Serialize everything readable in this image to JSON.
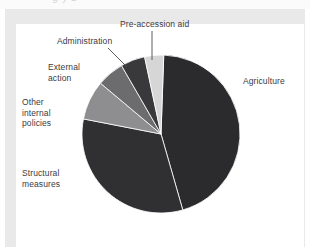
{
  "page": {
    "title_partial": "g      y      z",
    "background": "#ffffff",
    "frame_color": "#e9e9e9"
  },
  "chart_data": {
    "type": "pie",
    "title": "",
    "xlabel": "",
    "ylabel": "",
    "legend_position": "none",
    "labels_placement": "outside-with-leader-lines",
    "grid": false,
    "start_angle_deg": -90,
    "direction": "clockwise",
    "categories": [
      "Agriculture",
      "Structural measures",
      "Other internal policies",
      "External action",
      "Administration",
      "Pre-accession aid"
    ],
    "values": [
      45.0,
      32.5,
      8.0,
      5.5,
      5.0,
      4.0
    ],
    "slices": [
      {
        "label": "Agriculture",
        "value": 45.0,
        "color": "#2b2b2d",
        "start_deg": 2,
        "end_deg": 164
      },
      {
        "label": "Structural measures",
        "value": 32.5,
        "color": "#303032",
        "start_deg": 164,
        "end_deg": 281
      },
      {
        "label": "Other internal policies",
        "value": 8.0,
        "color": "#8e8e90",
        "start_deg": 281,
        "end_deg": 310
      },
      {
        "label": "External action",
        "value": 5.5,
        "color": "#6c6c6e",
        "start_deg": 310,
        "end_deg": 330
      },
      {
        "label": "Administration",
        "value": 5.0,
        "color": "#39393b",
        "start_deg": 330,
        "end_deg": 348
      },
      {
        "label": "Pre-accession aid",
        "value": 4.0,
        "color": "#d6d6d6",
        "start_deg": 348,
        "end_deg": 362
      }
    ],
    "geometry": {
      "center_x": 161,
      "center_y": 134,
      "radius": 79
    },
    "leader_lines": [
      {
        "label": "Administration",
        "x1": 108,
        "y1": 48,
        "x2": 127,
        "y2": 67
      },
      {
        "label": "Pre-accession aid",
        "x1": 152,
        "y1": 31,
        "x2": 152,
        "y2": 60
      }
    ]
  },
  "labels": {
    "agriculture": "Agriculture",
    "structural_measures": "Structural\nmeasures",
    "other_internal_policies": "Other\ninternal\npolicies",
    "external_action": "External\naction",
    "administration": "Administration",
    "pre_accession_aid": "Pre-accession aid"
  }
}
